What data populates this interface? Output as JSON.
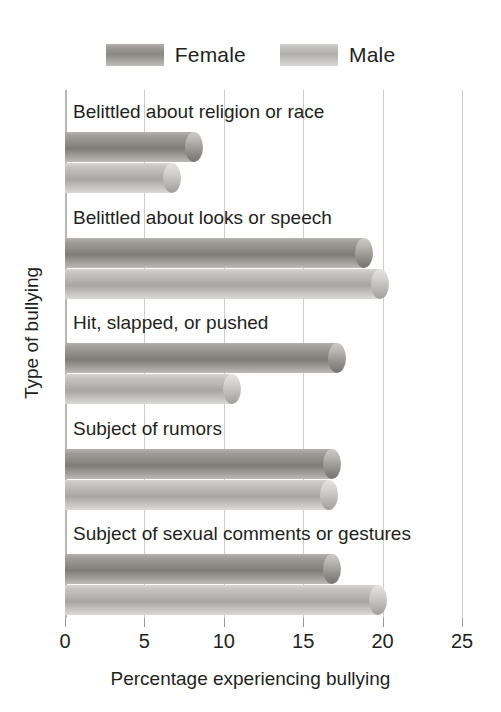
{
  "chart_data": {
    "type": "bar",
    "orientation": "horizontal",
    "title": "",
    "xlabel": "Percentage experiencing bullying",
    "ylabel": "Type of bullying",
    "xlim": [
      0,
      25
    ],
    "xticks": [
      0,
      5,
      10,
      15,
      20,
      25
    ],
    "xtick_labels": [
      "0",
      "5",
      "10",
      "15",
      "20",
      "25"
    ],
    "grid": true,
    "grid_axis": "x",
    "legend_position": "top-center",
    "categories": [
      "Belittled about religion or race",
      "Belittled about looks or speech",
      "Hit, slapped, or pushed",
      "Subject of rumors",
      "Subject of sexual comments or gestures"
    ],
    "series": [
      {
        "name": "Female",
        "color": "#8a8783",
        "values": [
          8.7,
          19.4,
          17.7,
          17.4,
          17.4
        ]
      },
      {
        "name": "Male",
        "color": "#b2b0ad",
        "values": [
          7.3,
          20.4,
          11.1,
          17.2,
          20.3
        ]
      }
    ]
  },
  "legend": {
    "items": [
      {
        "label": "Female",
        "swatch": "female-swatch"
      },
      {
        "label": "Male",
        "swatch": "male-swatch"
      }
    ]
  },
  "axes": {
    "x_title": "Percentage experiencing bullying",
    "y_title": "Type of bullying",
    "x_tick_labels": [
      "0",
      "5",
      "10",
      "15",
      "20",
      "25"
    ]
  }
}
